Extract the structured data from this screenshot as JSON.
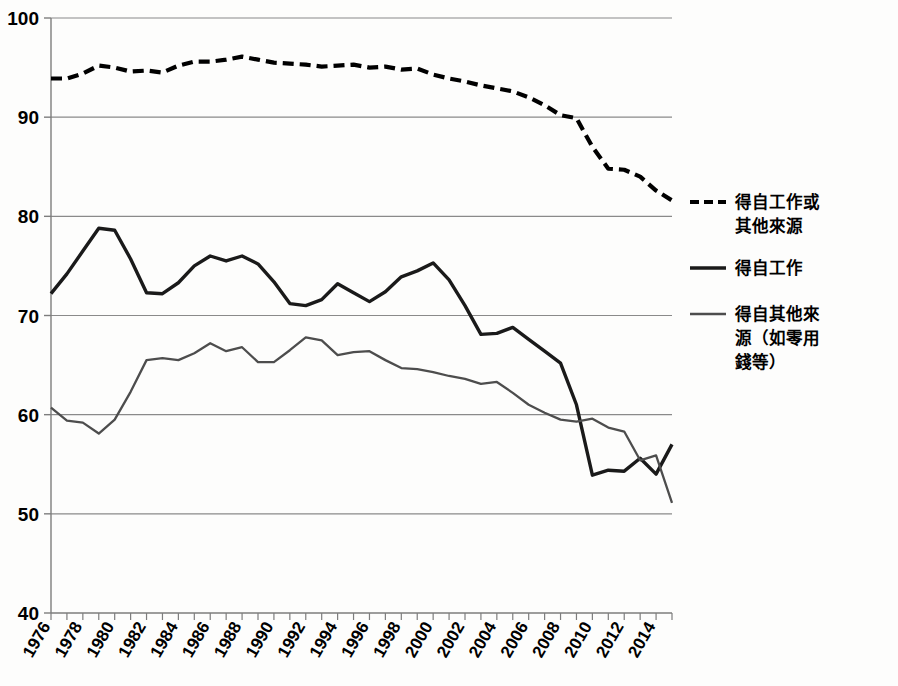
{
  "chart_data": {
    "type": "line",
    "title": "",
    "xlabel": "",
    "ylabel": "",
    "xlim": [
      1976,
      2015
    ],
    "ylim": [
      40,
      100
    ],
    "yticks": [
      40,
      50,
      60,
      70,
      80,
      90,
      100
    ],
    "ytick_labels": [
      "40",
      "50",
      "60",
      "70",
      "80",
      "90",
      "100"
    ],
    "grid": "horizontal",
    "legend_position": "right",
    "x": [
      1976,
      1977,
      1978,
      1979,
      1980,
      1981,
      1982,
      1983,
      1984,
      1985,
      1986,
      1987,
      1988,
      1989,
      1990,
      1991,
      1992,
      1993,
      1994,
      1995,
      1996,
      1997,
      1998,
      1999,
      2000,
      2001,
      2002,
      2003,
      2004,
      2005,
      2006,
      2007,
      2008,
      2009,
      2010,
      2011,
      2012,
      2013,
      2014,
      2015
    ],
    "xtick_labels": [
      "1976",
      "1978",
      "1980",
      "1982",
      "1984",
      "1986",
      "1988",
      "1990",
      "1992",
      "1994",
      "1996",
      "1998",
      "2000",
      "2002",
      "2004",
      "2006",
      "2008",
      "2010",
      "2012",
      "2014"
    ],
    "xticks": [
      1976,
      1978,
      1980,
      1982,
      1984,
      1986,
      1988,
      1990,
      1992,
      1994,
      1996,
      1998,
      2000,
      2002,
      2004,
      2006,
      2008,
      2010,
      2012,
      2014
    ],
    "series": [
      {
        "name": "得自工作或其他來源",
        "style": "dashed",
        "color": "#000000",
        "values": [
          93.9,
          93.9,
          94.4,
          95.2,
          95.0,
          94.6,
          94.7,
          94.5,
          95.2,
          95.6,
          95.6,
          95.8,
          96.1,
          95.8,
          95.5,
          95.4,
          95.3,
          95.1,
          95.2,
          95.3,
          95.0,
          95.1,
          94.8,
          94.9,
          94.3,
          93.9,
          93.6,
          93.2,
          92.9,
          92.6,
          92.0,
          91.2,
          90.2,
          89.9,
          87.0,
          84.8,
          84.7,
          84.0,
          82.6,
          81.6
        ]
      },
      {
        "name": "得自工作",
        "style": "solid",
        "color": "#1a1a1a",
        "values": [
          72.2,
          74.2,
          76.5,
          78.8,
          78.6,
          75.7,
          72.3,
          72.2,
          73.3,
          75.0,
          76.0,
          75.5,
          76.0,
          75.2,
          73.4,
          71.2,
          71.0,
          71.6,
          73.2,
          72.3,
          71.4,
          72.4,
          73.9,
          74.5,
          75.3,
          73.6,
          71.0,
          68.1,
          68.2,
          68.8,
          67.6,
          66.4,
          65.2,
          61.0,
          53.9,
          54.4,
          54.3,
          55.6,
          54.0,
          57.0
        ]
      },
      {
        "name": "得自其他來源（如零用錢等）",
        "style": "solid",
        "color": "#4d4d4d",
        "values": [
          60.7,
          59.4,
          59.2,
          58.1,
          59.5,
          62.3,
          65.5,
          65.7,
          65.5,
          66.2,
          67.2,
          66.4,
          66.8,
          65.3,
          65.3,
          66.5,
          67.8,
          67.5,
          66.0,
          66.3,
          66.4,
          65.5,
          64.7,
          64.6,
          64.3,
          63.9,
          63.6,
          63.1,
          63.3,
          62.2,
          61.0,
          60.2,
          59.5,
          59.3,
          59.6,
          58.7,
          58.3,
          55.4,
          55.9,
          51.1
        ]
      }
    ]
  },
  "legend": {
    "entries": [
      {
        "label_line1": "得自工作或",
        "label_line2": "其他來源",
        "style": "dashed"
      },
      {
        "label_line1": "得自工作",
        "label_line2": "",
        "style": "solid"
      },
      {
        "label_line1": "得自其他來",
        "label_line2": "源（如零用",
        "label_line3": "錢等）",
        "style": "solid"
      }
    ]
  },
  "colors": {
    "axis": "#7d7d7d",
    "grid": "#8a8a8a",
    "dashed_series": "#000000",
    "work_series": "#1a1a1a",
    "other_series": "#4d4d4d",
    "background": "#fdfdfc"
  }
}
